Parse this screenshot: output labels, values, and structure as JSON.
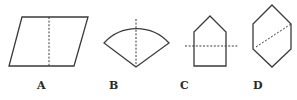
{
  "figure": {
    "options": [
      {
        "label": "A",
        "shape": "parallelogram",
        "line": "vertical dashed line through middle"
      },
      {
        "label": "B",
        "shape": "circular sector (fan)",
        "line": "vertical dashed line from arc top to apex"
      },
      {
        "label": "C",
        "shape": "house-shaped pentagon",
        "line": "horizontal dashed line across lower half"
      },
      {
        "label": "D",
        "shape": "hexagon",
        "line": "diagonal dashed line from lower-left to upper-right"
      }
    ],
    "colors": {
      "stroke": "#3a3a3a",
      "background": "#ffffff",
      "label": "#2a2a2a"
    }
  }
}
